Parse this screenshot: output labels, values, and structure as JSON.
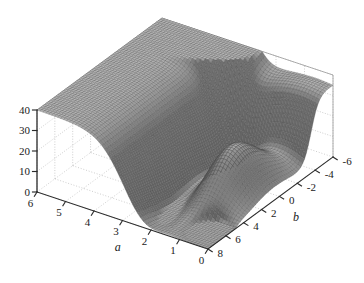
{
  "chart_data": {
    "type": "surface",
    "title": "",
    "xlabel": "a",
    "ylabel": "b",
    "zlabel": "",
    "grid": true,
    "legend": false,
    "projection": "3d-mesh",
    "colormap": "grayscale",
    "mesh_style": "wireframe-dense",
    "axes": {
      "a": {
        "label": "a",
        "min": 0,
        "max": 6,
        "ticks": [
          6,
          5,
          4,
          3,
          2,
          1,
          0
        ],
        "tick_labels": [
          "6",
          "5",
          "4",
          "3",
          "2",
          "1",
          "0"
        ],
        "direction": "decreasing-left-to-right"
      },
      "b": {
        "label": "b",
        "min": -6,
        "max": 8,
        "ticks": [
          8,
          6,
          4,
          2,
          0,
          -2,
          -4,
          -6
        ],
        "tick_labels": [
          "8",
          "6",
          "4",
          "2",
          "0",
          "-2",
          "-4",
          "-6"
        ],
        "direction": "decreasing-front-to-back"
      },
      "z": {
        "label": "",
        "min": 0,
        "max": 40,
        "ticks": [
          0,
          10,
          20,
          30,
          40
        ],
        "tick_labels": [
          "0",
          "10",
          "20",
          "30",
          "40"
        ]
      }
    },
    "view": {
      "azimuth": -37.5,
      "elevation": 22
    },
    "surface_extents": {
      "z_max_observed": 40,
      "z_min_observed": 0
    },
    "colors": {
      "mesh_line": "#4a4a4a",
      "mesh_fill": "#8e8e8e",
      "axis_line": "#2b2b2b",
      "grid_line": "#b9b9b9",
      "background": "#ffffff"
    }
  },
  "figure": {
    "x_axis_title": "a",
    "y_axis_title": "b",
    "z_tick_labels": [
      "40",
      "30",
      "20",
      "10",
      "0"
    ],
    "a_tick_labels": [
      "6",
      "5",
      "4",
      "3",
      "2",
      "1",
      "0"
    ],
    "b_tick_labels": [
      "8",
      "6",
      "4",
      "2",
      "0",
      "-2",
      "-4",
      "-6"
    ]
  }
}
